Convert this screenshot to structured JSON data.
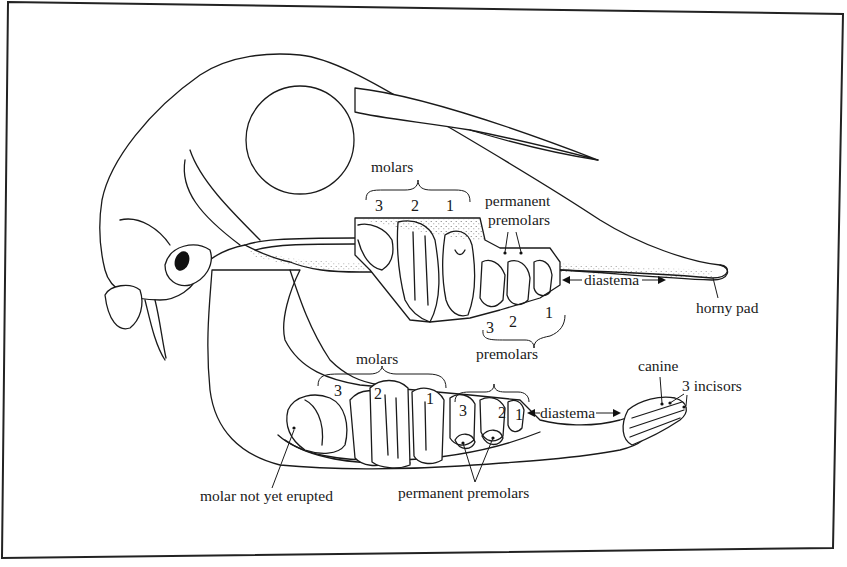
{
  "figure": {
    "frame_color": "#222222",
    "ink_color": "#1a1a1a",
    "background": "#ffffff"
  },
  "upper_jaw": {
    "molars_label": "molars",
    "molar_numbers": [
      "3",
      "2",
      "1"
    ],
    "permanent_premolars_label_line1": "permanent",
    "permanent_premolars_label_line2": "premolars",
    "premolar_numbers": [
      "3",
      "2",
      "1"
    ],
    "premolars_label": "premolars",
    "diastema_label": "diastema",
    "horny_pad_label": "horny pad"
  },
  "lower_jaw": {
    "molars_label": "molars",
    "molar_numbers": [
      "3",
      "2",
      "1"
    ],
    "premolars_label": "premolars",
    "premolar_numbers": [
      "3",
      "2",
      "1"
    ],
    "diastema_label": "diastema",
    "canine_label": "canine",
    "incisors_label": "3 incisors",
    "molar_not_erupted_label": "molar not yet erupted",
    "permanent_premolars_label": "permanent premolars"
  }
}
